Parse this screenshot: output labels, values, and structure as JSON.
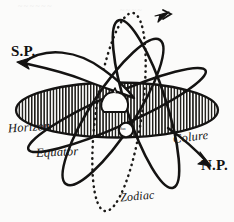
{
  "figure": {
    "background_color": "#fbfbfa",
    "ink_color": "#141312",
    "labels": {
      "south_pole": "S.P.",
      "north_pole": "N.P.",
      "horizon": "Horizon",
      "equator": "Equator",
      "colure": "Colure",
      "zodiac": "Zodiac",
      "center_marker": "Sun"
    },
    "elements": [
      {
        "name": "horizon-plane",
        "kind": "hatched-ellipse",
        "style": "vertical hatching"
      },
      {
        "name": "meridian-ring",
        "kind": "ellipse-outline",
        "endpoints": [
          "S.P.",
          "N.P."
        ]
      },
      {
        "name": "equator-ring",
        "kind": "ellipse-outline"
      },
      {
        "name": "colure-ring",
        "kind": "ellipse-outline",
        "arrow": "top"
      },
      {
        "name": "zodiac-ring",
        "kind": "dotted-ellipse"
      },
      {
        "name": "earth-dome",
        "kind": "dome-shape"
      },
      {
        "name": "observer-marker",
        "kind": "small-circle"
      }
    ],
    "bleed_through": [
      "~~~~~~",
      "~~~~"
    ]
  }
}
